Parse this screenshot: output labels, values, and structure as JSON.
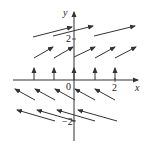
{
  "diagram": {
    "type": "direction-field",
    "axes": {
      "x_label": "x",
      "y_label": "y",
      "origin_label": "0",
      "x_tick_label": "2",
      "y_tick_label_pos": "2",
      "y_tick_label_neg": "−2"
    },
    "colors": {
      "stroke": "#333333",
      "background": "#ffffff"
    },
    "rows": [
      {
        "y": 2,
        "arrows": [
          {
            "x1": 33,
            "y1": 37,
            "x2": 72,
            "y2": 27
          },
          {
            "x1": 53,
            "y1": 36,
            "x2": 93,
            "y2": 26
          },
          {
            "x1": 94,
            "y1": 36,
            "x2": 135,
            "y2": 26
          }
        ]
      },
      {
        "y": 1,
        "arrows": [
          {
            "x1": 34,
            "y1": 58,
            "x2": 53,
            "y2": 47
          },
          {
            "x1": 54,
            "y1": 58,
            "x2": 73,
            "y2": 47
          },
          {
            "x1": 74,
            "y1": 57,
            "x2": 95,
            "y2": 47
          },
          {
            "x1": 95,
            "y1": 58,
            "x2": 115,
            "y2": 47
          },
          {
            "x1": 115,
            "y1": 58,
            "x2": 136,
            "y2": 47
          }
        ]
      },
      {
        "y": 0,
        "arrows": [
          {
            "x1": 34,
            "y1": 80,
            "x2": 34,
            "y2": 68
          },
          {
            "x1": 54,
            "y1": 80,
            "x2": 54,
            "y2": 68
          },
          {
            "x1": 74,
            "y1": 80,
            "x2": 74,
            "y2": 68
          },
          {
            "x1": 95,
            "y1": 80,
            "x2": 95,
            "y2": 68
          },
          {
            "x1": 115,
            "y1": 80,
            "x2": 115,
            "y2": 68
          }
        ]
      },
      {
        "y": -1,
        "arrows": [
          {
            "x1": 35,
            "y1": 100,
            "x2": 15,
            "y2": 89
          },
          {
            "x1": 55,
            "y1": 100,
            "x2": 35,
            "y2": 89
          },
          {
            "x1": 75,
            "y1": 100,
            "x2": 55,
            "y2": 89
          },
          {
            "x1": 95,
            "y1": 100,
            "x2": 75,
            "y2": 89
          },
          {
            "x1": 115,
            "y1": 100,
            "x2": 95,
            "y2": 89
          }
        ]
      },
      {
        "y": -2,
        "arrows": [
          {
            "x1": 55,
            "y1": 121,
            "x2": 17,
            "y2": 110
          },
          {
            "x1": 75,
            "y1": 121,
            "x2": 37,
            "y2": 110
          },
          {
            "x1": 95,
            "y1": 121,
            "x2": 57,
            "y2": 110
          },
          {
            "x1": 117,
            "y1": 121,
            "x2": 78,
            "y2": 110
          }
        ]
      }
    ]
  }
}
